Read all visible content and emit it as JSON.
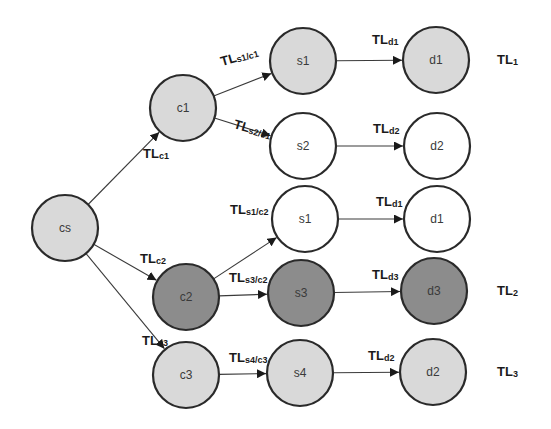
{
  "diagram": {
    "type": "tree",
    "colors": {
      "light": "#d9d9d9",
      "dark": "#8c8c8c",
      "white": "#ffffff",
      "stroke": "#2a2a2a"
    },
    "nodes": [
      {
        "id": "cs",
        "label": "cs",
        "fill": "light"
      },
      {
        "id": "c1",
        "label": "c1",
        "fill": "light"
      },
      {
        "id": "c2",
        "label": "c2",
        "fill": "dark"
      },
      {
        "id": "c3",
        "label": "c3",
        "fill": "light"
      },
      {
        "id": "s1a",
        "label": "s1",
        "fill": "light"
      },
      {
        "id": "s2",
        "label": "s2",
        "fill": "white"
      },
      {
        "id": "s1b",
        "label": "s1",
        "fill": "white"
      },
      {
        "id": "s3",
        "label": "s3",
        "fill": "dark"
      },
      {
        "id": "s4",
        "label": "s4",
        "fill": "light"
      },
      {
        "id": "d1a",
        "label": "d1",
        "fill": "light"
      },
      {
        "id": "d2a",
        "label": "d2",
        "fill": "white"
      },
      {
        "id": "d1b",
        "label": "d1",
        "fill": "white"
      },
      {
        "id": "d3",
        "label": "d3",
        "fill": "dark"
      },
      {
        "id": "d2b",
        "label": "d2",
        "fill": "light"
      }
    ],
    "edges": [
      {
        "from": "cs",
        "to": "c1",
        "label": "TL",
        "sub": "c1"
      },
      {
        "from": "cs",
        "to": "c2",
        "label": "TL",
        "sub": "c2"
      },
      {
        "from": "cs",
        "to": "c3",
        "label": "TL",
        "sub": "c3"
      },
      {
        "from": "c1",
        "to": "s1a",
        "label": "TL",
        "sub": "s1/c1"
      },
      {
        "from": "c1",
        "to": "s2",
        "label": "TL",
        "sub": "s2/c1"
      },
      {
        "from": "c2",
        "to": "s1b",
        "label": "TL",
        "sub": "s1/c2"
      },
      {
        "from": "c2",
        "to": "s3",
        "label": "TL",
        "sub": "s3/c2"
      },
      {
        "from": "c3",
        "to": "s4",
        "label": "TL",
        "sub": "s4/c3"
      },
      {
        "from": "s1a",
        "to": "d1a",
        "label": "TL",
        "sub": "d1"
      },
      {
        "from": "s2",
        "to": "d2a",
        "label": "TL",
        "sub": "d2"
      },
      {
        "from": "s1b",
        "to": "d1b",
        "label": "TL",
        "sub": "d1"
      },
      {
        "from": "s3",
        "to": "d3",
        "label": "TL",
        "sub": "d3"
      },
      {
        "from": "s4",
        "to": "d2b",
        "label": "TL",
        "sub": "d2"
      }
    ],
    "path_labels": [
      {
        "row": "d1a",
        "label": "TL",
        "sub": "1"
      },
      {
        "row": "d3",
        "label": "TL",
        "sub": "2"
      },
      {
        "row": "d2b",
        "label": "TL",
        "sub": "3"
      }
    ]
  }
}
